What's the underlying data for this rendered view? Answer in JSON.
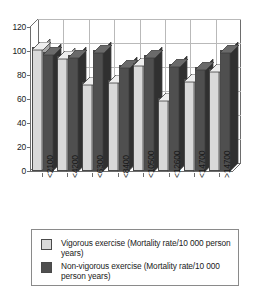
{
  "chart_data": {
    "type": "bar",
    "title": "",
    "subtitle": "",
    "xlabel": "",
    "ylabel": "",
    "categories": [
      "<2100",
      "<4200",
      "<6300",
      "<8400",
      "<10500",
      "<12600",
      "<14700",
      ">14700"
    ],
    "series": [
      {
        "name": "Vigorous exercise (Mortality rate/10 000 person years)",
        "short_name": "Vigorous exercise",
        "color": "#d9d9d9",
        "values": [
          103,
          96,
          74,
          76,
          90,
          61,
          77,
          85
        ]
      },
      {
        "name": "Non-vigorous exercise (Mortality rate/10 000 person years)",
        "short_name": "Non-vigorous exercise",
        "color": "#4f4f4f",
        "values": [
          99,
          97,
          101,
          88,
          97,
          89,
          87,
          101
        ]
      }
    ],
    "ylim": [
      0,
      120
    ],
    "ytick_labels": [
      "0",
      "20",
      "40",
      "60",
      "80",
      "100",
      "120"
    ],
    "ytick_values": [
      0,
      20,
      40,
      60,
      80,
      100,
      120
    ],
    "grid": true,
    "grid_axis": "both",
    "legend_position": "bottom",
    "style": "3d-bar"
  },
  "legend": {
    "items": [
      {
        "swatch": "light",
        "label": "Vigorous exercise (Mortality rate/10 000 person years)"
      },
      {
        "swatch": "dark",
        "label": "Non-vigorous exercise (Mortality rate/10 000 person years)"
      }
    ]
  },
  "colors": {
    "vigorous": "#d9d9d9",
    "non_vigorous": "#4f4f4f",
    "grid": "#b9b9b9",
    "axis": "#6d6d6d",
    "background": "#ffffff"
  }
}
